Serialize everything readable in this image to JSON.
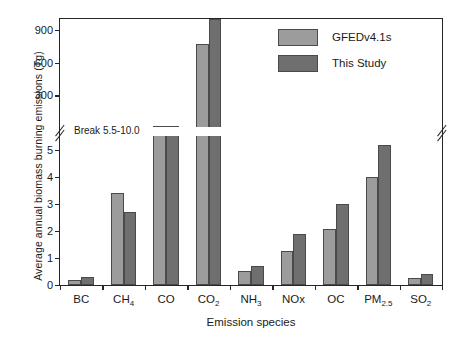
{
  "chart_data": {
    "type": "bar",
    "title": "",
    "xlabel": "Emission species",
    "ylabel": "Average annual biomass burning emissions (Tg)",
    "categories": [
      "BC",
      "CH4",
      "CO",
      "CO2",
      "NH3",
      "NOx",
      "OC",
      "PM2.5",
      "SO2"
    ],
    "category_labels": [
      "BC",
      "CH₄",
      "CO",
      "CO₂",
      "NH₃",
      "NOx",
      "OC",
      "PM₂.₅",
      "SO₂"
    ],
    "series": [
      {
        "name": "GFEDv4.1s",
        "color": "#9c9c9c",
        "values": [
          0.18,
          3.4,
          13.0,
          770,
          0.52,
          1.27,
          2.05,
          4.0,
          0.25
        ]
      },
      {
        "name": "This Study",
        "color": "#6f6f6f",
        "values": [
          0.3,
          2.7,
          13.2,
          1000,
          0.7,
          1.9,
          3.0,
          5.15,
          0.4
        ]
      }
    ],
    "axis_break": {
      "label": "Break 5.5-10.0",
      "lower_range": [
        0,
        5.5
      ],
      "upper_range": [
        10.0,
        1000
      ]
    },
    "yticks_lower": [
      "0",
      "1",
      "2",
      "3",
      "4",
      "5"
    ],
    "ytick_values_lower": [
      0,
      1,
      2,
      3,
      4,
      5
    ],
    "yticks_upper": [
      "300",
      "600",
      "900"
    ],
    "ytick_values_upper": [
      300,
      600,
      900
    ],
    "grid": false,
    "legend_position": "top-right"
  },
  "legend": {
    "entries": [
      {
        "label": "GFEDv4.1s"
      },
      {
        "label": "This Study"
      }
    ]
  }
}
